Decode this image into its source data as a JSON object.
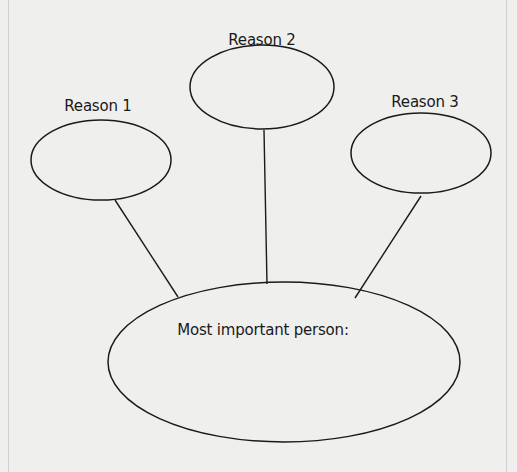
{
  "diagram": {
    "type": "graphic-organizer",
    "center_node": {
      "label": "Most important person:",
      "cx": 284,
      "cy": 362,
      "rx": 176,
      "ry": 80,
      "label_x": 263,
      "label_y": 330
    },
    "reason_nodes": [
      {
        "label": "Reason 1",
        "cx": 101,
        "cy": 160,
        "rx": 70,
        "ry": 40,
        "label_x": 98,
        "label_y": 106,
        "connector": {
          "x1": 115,
          "y1": 200,
          "x2": 178,
          "y2": 297
        }
      },
      {
        "label": "Reason 2",
        "cx": 262,
        "cy": 87,
        "rx": 72,
        "ry": 42,
        "label_x": 262,
        "label_y": 40,
        "connector": {
          "x1": 264,
          "y1": 130,
          "x2": 267,
          "y2": 284
        }
      },
      {
        "label": "Reason 3",
        "cx": 421,
        "cy": 153,
        "rx": 70,
        "ry": 40,
        "label_x": 425,
        "label_y": 102,
        "connector": {
          "x1": 421,
          "y1": 196,
          "x2": 355,
          "y2": 298
        }
      }
    ],
    "colors": {
      "stroke": "#1a1a1a",
      "background": "#efefee",
      "page_border": "#cfcfcf"
    }
  }
}
